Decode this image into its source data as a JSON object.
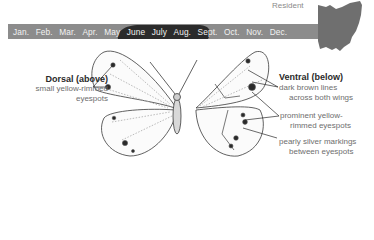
{
  "status": {
    "label": "Resident"
  },
  "range_map": {
    "icon": "ohio-state-map-icon",
    "fill_color": "#6f6f6f"
  },
  "flight_period": {
    "bar_color": "#8c8c8c",
    "highlight_color": "#2b2b2b",
    "text_color": "#f2f2f2",
    "months": [
      "Jan.",
      "Feb.",
      "Mar.",
      "Apr.",
      "May",
      "June",
      "July",
      "Aug.",
      "Sept.",
      "Oct.",
      "Nov.",
      "Dec."
    ],
    "active_months": [
      "May",
      "June",
      "July",
      "Aug."
    ]
  },
  "dorsal": {
    "title": "Dorsal (above)",
    "notes": [
      "small yellow-rimmed",
      "eyespots"
    ]
  },
  "ventral": {
    "title": "Ventral (below)",
    "notes": [
      {
        "lines": [
          "dark brown lines",
          "across both wings"
        ]
      },
      {
        "lines": [
          "prominent yellow-",
          "rimmed eyespots"
        ]
      },
      {
        "lines": [
          "pearly silver markings",
          "between eyespots"
        ]
      }
    ]
  }
}
